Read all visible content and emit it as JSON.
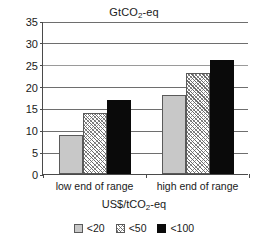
{
  "chart_data": {
    "type": "bar",
    "title": "GtCO2-eq",
    "title_parts": {
      "pre": "GtCO",
      "sub": "2",
      "post": "-eq"
    },
    "xlabel": "US$/tCO2-eq",
    "xlabel_parts": {
      "pre": "US$/tCO",
      "sub": "2",
      "post": "-eq"
    },
    "ylabel": "",
    "categories": [
      "low end of range",
      "high end of range"
    ],
    "series": [
      {
        "name": "<20",
        "values": [
          9,
          18
        ],
        "fill": "solid-light-gray",
        "color": "#c8c8c8"
      },
      {
        "name": "<50",
        "values": [
          14,
          23
        ],
        "fill": "hatched",
        "color": "#ffffff"
      },
      {
        "name": "<100",
        "values": [
          17,
          26
        ],
        "fill": "solid-black",
        "color": "#0a0a0a"
      }
    ],
    "ylim": [
      0,
      35
    ],
    "ytick_step": 5,
    "yticks": [
      35,
      30,
      25,
      20,
      15,
      10,
      5,
      0
    ],
    "ytick_labels": [
      "35",
      "30",
      "25",
      "20",
      "15",
      "10",
      "5",
      "0"
    ],
    "grid": true,
    "grid_axis": "y",
    "legend_position": "bottom"
  },
  "legend": {
    "items": [
      {
        "label": "<20"
      },
      {
        "label": "<50"
      },
      {
        "label": "<100"
      }
    ]
  }
}
